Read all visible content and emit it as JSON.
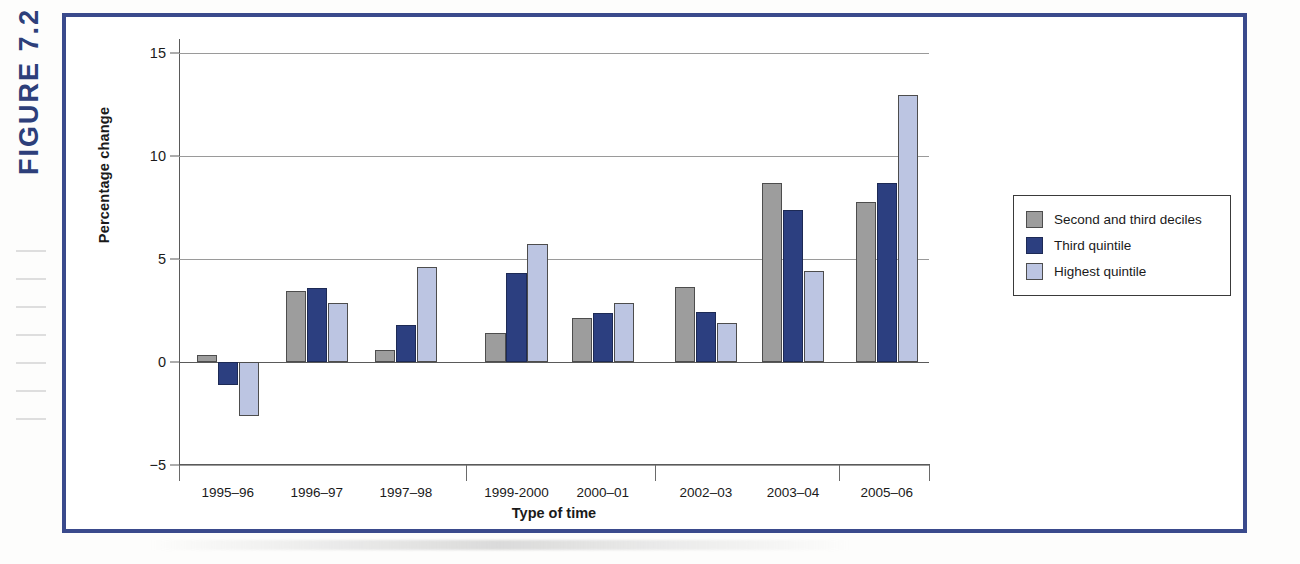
{
  "figure": {
    "label": "FIGURE 7.2"
  },
  "chart_data": {
    "type": "bar",
    "title": "",
    "xlabel": "Type of time",
    "ylabel": "Percentage change",
    "categories": [
      "1995–96",
      "1996–97",
      "1997–98",
      "1999-2000",
      "2000–01",
      "2002–03",
      "2003–04",
      "2005–06"
    ],
    "series": [
      {
        "name": "Second and third deciles",
        "color": "#9d9d9d",
        "values": [
          0.35,
          3.45,
          0.6,
          1.4,
          2.15,
          3.65,
          8.7,
          7.75
        ]
      },
      {
        "name": "Third quintile",
        "color": "#2c3f80",
        "values": [
          -1.1,
          3.6,
          1.8,
          4.3,
          2.4,
          2.45,
          7.4,
          8.7
        ]
      },
      {
        "name": "Highest quintile",
        "color": "#bcc5e2",
        "values": [
          -2.6,
          2.85,
          4.6,
          5.75,
          2.85,
          1.9,
          4.4,
          12.95
        ]
      }
    ],
    "ylim": [
      -5,
      15
    ],
    "yticks": [
      15,
      10,
      5,
      0,
      -5
    ],
    "ytick_labels": [
      "15",
      "10",
      "5",
      "0",
      "−5"
    ],
    "grid": true,
    "legend_position": "right"
  }
}
